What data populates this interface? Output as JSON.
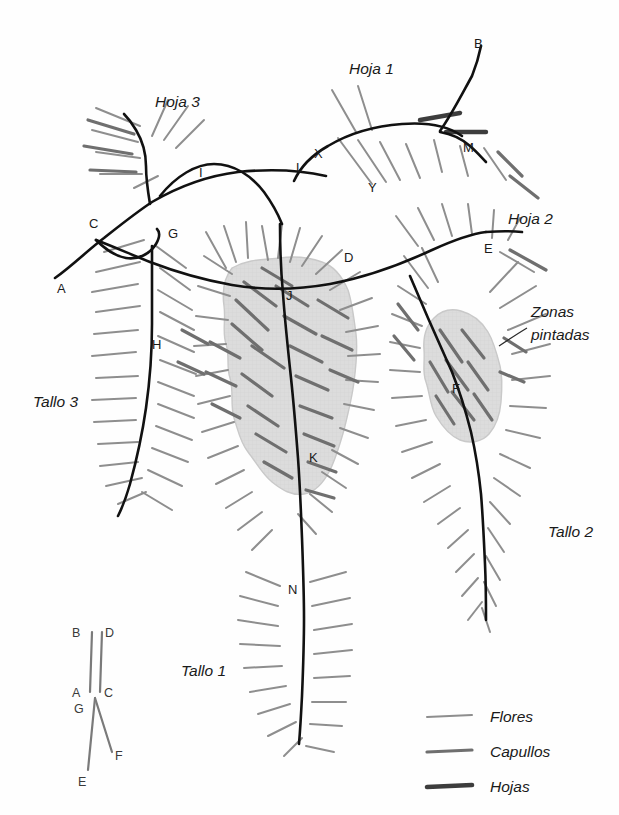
{
  "figure": {
    "background_color": "#fefefe",
    "shade_fill": "#dcdcdc",
    "shade_stroke": "#c4c4c4",
    "stem_color": "#111111",
    "flower_color": "#8e8e8e",
    "bud_color": "#6f6f6f",
    "leaf_color": "#4a4a4a"
  },
  "part_labels": {
    "hoja_1": "Hoja 1",
    "hoja_2": "Hoja 2",
    "hoja_3": "Hoja 3",
    "tallo_1": "Tallo 1",
    "tallo_2": "Tallo 2",
    "tallo_3": "Tallo 3",
    "zonas_pintadas_line1": "Zonas",
    "zonas_pintadas_line2": "pintadas"
  },
  "point_labels": {
    "A": "A",
    "B": "B",
    "C": "C",
    "D": "D",
    "E": "E",
    "F": "F",
    "G": "G",
    "H": "H",
    "I": "I",
    "J": "J",
    "K": "K",
    "L": "L",
    "M": "M",
    "N": "N",
    "X": "X",
    "Y": "Y"
  },
  "inset": {
    "labels": {
      "A": "A",
      "B": "B",
      "C": "C",
      "D": "D",
      "E": "E",
      "F": "F",
      "G": "G"
    }
  },
  "legend": {
    "items": [
      {
        "label": "Flores",
        "color": "#8e8e8e",
        "width": 2.0
      },
      {
        "label": "Capullos",
        "color": "#6f6f6f",
        "width": 3.2
      },
      {
        "label": "Hojas",
        "color": "#3d3d3d",
        "width": 4.6
      }
    ]
  }
}
